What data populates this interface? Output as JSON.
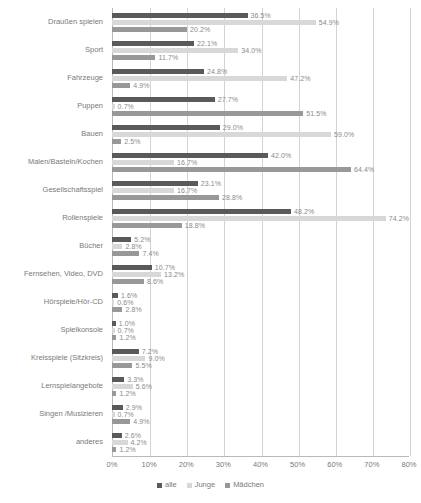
{
  "chart_data": {
    "type": "bar",
    "orientation": "horizontal",
    "title": "",
    "xlabel": "",
    "ylabel": "",
    "xlim": [
      0,
      80
    ],
    "xticks": [
      "0%",
      "10%",
      "20%",
      "30%",
      "40%",
      "50%",
      "60%",
      "70%",
      "80%"
    ],
    "grid": true,
    "legend_position": "bottom",
    "value_suffix": "%",
    "categories": [
      "Draußen spielen",
      "Sport",
      "Fahrzeuge",
      "Puppen",
      "Bauen",
      "Malen/Basteln/Kochen",
      "Gesellschaftsspiel",
      "Rollenspiele",
      "Bücher",
      "Fernsehen, Video, DVD",
      "Hörspiele/Hör-CD",
      "Spielkonsole",
      "Kreisspiele (Sitzkreis)",
      "Lernspielangebote",
      "Singen /Musizieren",
      "anderes"
    ],
    "series": [
      {
        "name": "alle",
        "color": "#5a5a5a",
        "values": [
          36.5,
          22.1,
          24.8,
          27.7,
          29.0,
          42.0,
          23.1,
          48.2,
          5.2,
          10.7,
          1.6,
          1.0,
          7.2,
          3.3,
          2.9,
          2.6
        ],
        "labels": [
          "36.5%",
          "22.1%",
          "24.8%",
          "27.7%",
          "29.0%",
          "42.0%",
          "23.1%",
          "48.2%",
          "5.2%",
          "10.7%",
          "1.6%",
          "1.0%",
          "7.2%",
          "3.3%",
          "2.9%",
          "2.6%"
        ]
      },
      {
        "name": "Junge",
        "color": "#d8d8d8",
        "values": [
          54.9,
          34.0,
          47.2,
          0.7,
          59.0,
          16.7,
          16.7,
          74.2,
          2.8,
          13.2,
          0.6,
          0.7,
          9.0,
          5.6,
          0.7,
          4.2
        ],
        "labels": [
          "54.9%",
          "34.0%",
          "47.2%",
          "0.7%",
          "59.0%",
          "16.7%",
          "16.7%",
          "74.2%",
          "2.8%",
          "13.2%",
          "0.6%",
          "0.7%",
          "9.0%",
          "5.6%",
          "0.7%",
          "4.2%"
        ]
      },
      {
        "name": "Mädchen",
        "color": "#989898",
        "values": [
          20.2,
          11.7,
          4.9,
          51.5,
          2.5,
          64.4,
          28.8,
          18.8,
          7.4,
          8.6,
          2.8,
          1.2,
          5.5,
          1.2,
          4.9,
          1.2
        ],
        "labels": [
          "20.2%",
          "11.7%",
          "4.9%",
          "51.5%",
          "2.5%",
          "64.4%",
          "28.8%",
          "18.8%",
          "7.4%",
          "8.6%",
          "2.8%",
          "1.2%",
          "5.5%",
          "1.2%",
          "4.9%",
          "1.2%"
        ]
      }
    ],
    "series_order_in_group": [
      "alle",
      "Junge",
      "Mädchen"
    ],
    "legend": [
      "alle",
      "Junge",
      "Mädchen"
    ]
  }
}
